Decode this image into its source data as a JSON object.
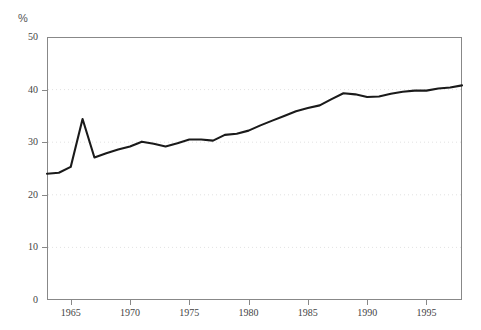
{
  "chart_data": {
    "type": "line",
    "title": "",
    "subtitle": "",
    "xlabel": "",
    "ylabel": "%",
    "unit_label": "%",
    "xlim": [
      1963,
      1998
    ],
    "ylim": [
      0,
      50
    ],
    "grid": true,
    "grid_values": [
      10,
      20,
      30,
      40
    ],
    "legend": [],
    "legend_position": "none",
    "yticks": [
      0,
      10,
      20,
      30,
      40,
      50
    ],
    "ytick_labels": [
      "0",
      "10",
      "20",
      "30",
      "40",
      "50"
    ],
    "xticks": [
      1965,
      1970,
      1975,
      1980,
      1985,
      1990,
      1995
    ],
    "xtick_labels": [
      "1965",
      "1970",
      "1975",
      "1980",
      "1985",
      "1990",
      "1995"
    ],
    "series": [
      {
        "name": "share",
        "color": "#1a1a1a",
        "x": [
          1963,
          1964,
          1965,
          1966,
          1967,
          1968,
          1969,
          1970,
          1971,
          1972,
          1973,
          1974,
          1975,
          1976,
          1977,
          1978,
          1979,
          1980,
          1981,
          1982,
          1983,
          1984,
          1985,
          1986,
          1987,
          1988,
          1989,
          1990,
          1991,
          1992,
          1993,
          1994,
          1995,
          1996,
          1997,
          1998
        ],
        "values": [
          24.0,
          24.2,
          25.3,
          34.4,
          27.1,
          27.9,
          28.6,
          29.2,
          30.1,
          29.7,
          29.2,
          29.8,
          30.5,
          30.5,
          30.3,
          31.4,
          31.6,
          32.2,
          33.2,
          34.1,
          35.0,
          35.9,
          36.5,
          37.0,
          38.2,
          39.3,
          39.1,
          38.6,
          38.7,
          39.2,
          39.6,
          39.8,
          39.8,
          40.2,
          40.4,
          40.8
        ]
      }
    ]
  },
  "axes": {
    "frame_color": "#888888",
    "grid_color": "#e2e2e2"
  }
}
